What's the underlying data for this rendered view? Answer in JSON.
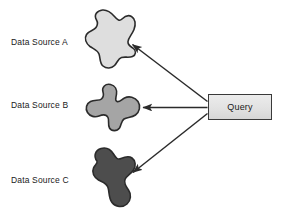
{
  "diagram": {
    "background_color": "#ffffff",
    "labels": {
      "source_a": "Data Source A",
      "source_b": "Data Source B",
      "source_c": "Data Source C"
    },
    "query_node": {
      "label": "Query",
      "shape": "rectangle",
      "fill_color": "#e4e4e4",
      "border_color": "#3a3a3a"
    },
    "shapes": [
      {
        "name": "data-source-a-blob",
        "label": "Data Source A",
        "fill_color": "#dedede",
        "stroke_color": "#2b2b2b"
      },
      {
        "name": "data-source-b-blob",
        "label": "Data Source B",
        "fill_color": "#a5a5a5",
        "stroke_color": "#2b2b2b"
      },
      {
        "name": "data-source-c-blob",
        "label": "Data Source C",
        "fill_color": "#4d4d4d",
        "stroke_color": "#2b2b2b"
      }
    ],
    "connectors": [
      {
        "name": "arrow-query-to-source-a",
        "from": "Query",
        "to": "Data Source A",
        "direction": "to-source",
        "color": "#2b2b2b"
      },
      {
        "name": "arrow-query-to-source-b",
        "from": "Query",
        "to": "Data Source B",
        "direction": "to-source",
        "color": "#2b2b2b"
      },
      {
        "name": "arrow-query-to-source-c",
        "from": "Query",
        "to": "Data Source C",
        "direction": "to-source",
        "color": "#2b2b2b"
      }
    ]
  }
}
